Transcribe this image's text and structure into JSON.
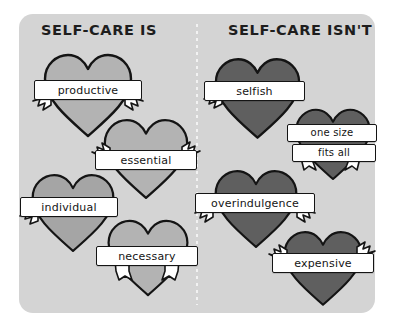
{
  "poster": {
    "background_color": "#ffffff",
    "card_color": "#d4d4d4",
    "divider_style": "dotted-vertical",
    "ink_color": "#141414"
  },
  "columns": [
    {
      "id": "is",
      "title": "SELF-CARE IS",
      "heart_color": "#b3b3b3",
      "items": [
        {
          "label": "productive"
        },
        {
          "label": "essential"
        },
        {
          "label": "individual"
        },
        {
          "label": "necessary"
        }
      ]
    },
    {
      "id": "isnt",
      "title": "SELF-CARE ISN'T",
      "heart_color": "#5f5f5f",
      "items": [
        {
          "label": "selfish"
        },
        {
          "label": "one size",
          "label2": "fits all"
        },
        {
          "label": "overindulgence"
        },
        {
          "label": "expensive"
        }
      ]
    }
  ]
}
